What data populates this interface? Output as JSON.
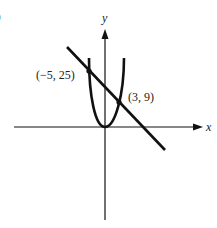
{
  "figure": {
    "part_label": "b",
    "axes": {
      "x_label": "x",
      "y_label": "y"
    },
    "points": [
      {
        "label": "(−5, 25)",
        "x": -5,
        "y": 25
      },
      {
        "label": "(3, 9)",
        "x": 3,
        "y": 9
      }
    ],
    "curves": [
      {
        "name": "parabola",
        "equation": "y = x^2"
      },
      {
        "name": "line",
        "equation": "y = -2x + 15"
      }
    ],
    "colors": {
      "ink": "#111111",
      "background": "#ffffff"
    }
  }
}
